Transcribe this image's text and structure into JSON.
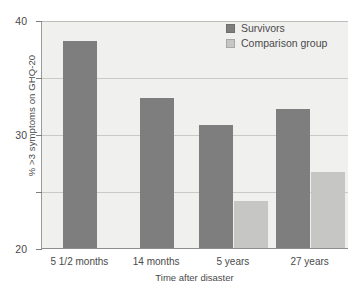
{
  "chart_data": {
    "type": "bar",
    "title": "",
    "xlabel": "Time after disaster",
    "ylabel": "% >3 symptoms on GHQ-20",
    "categories": [
      "5 1/2 months",
      "14 months",
      "5 years",
      "27 years"
    ],
    "series": [
      {
        "name": "Survivors",
        "color": "#7e7e7e",
        "values": [
          36.3,
          26.3,
          21.6,
          24.4
        ]
      },
      {
        "name": "Comparison group",
        "color": "#c6c6c4",
        "values": [
          null,
          null,
          8.2,
          13.3
        ]
      }
    ],
    "ylim": [
      0,
      40
    ],
    "yticks": [
      0,
      10,
      20,
      30,
      40
    ],
    "ytick_labels": [
      "0",
      "10",
      "20",
      "30",
      "40"
    ],
    "grid": true,
    "legend_position": "top-right",
    "plot_background": "#f0f0ef"
  }
}
